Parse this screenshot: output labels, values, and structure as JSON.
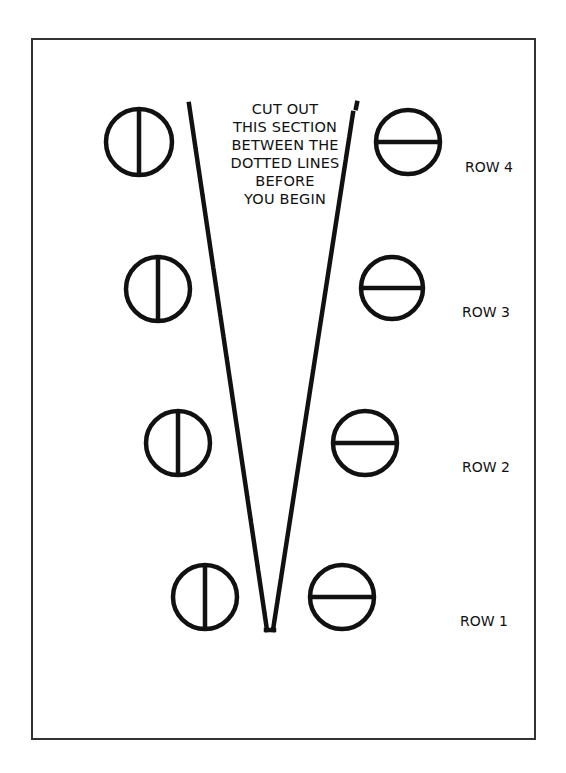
{
  "instructions": {
    "lines": [
      "CUT OUT",
      "THIS SECTION",
      "BETWEEN THE",
      "DOTTED LINES",
      "BEFORE",
      "YOU BEGIN"
    ]
  },
  "rows": [
    {
      "label": "ROW 4",
      "left_symbol": "circle-vertical-bar",
      "right_symbol": "circle-horizontal-bar"
    },
    {
      "label": "ROW 3",
      "left_symbol": "circle-vertical-bar",
      "right_symbol": "circle-horizontal-bar"
    },
    {
      "label": "ROW 2",
      "left_symbol": "circle-vertical-bar",
      "right_symbol": "circle-horizontal-bar"
    },
    {
      "label": "ROW 1",
      "left_symbol": "circle-vertical-bar",
      "right_symbol": "circle-horizontal-bar"
    }
  ],
  "colors": {
    "ink": "#111111",
    "border": "#333333",
    "background": "#ffffff"
  }
}
